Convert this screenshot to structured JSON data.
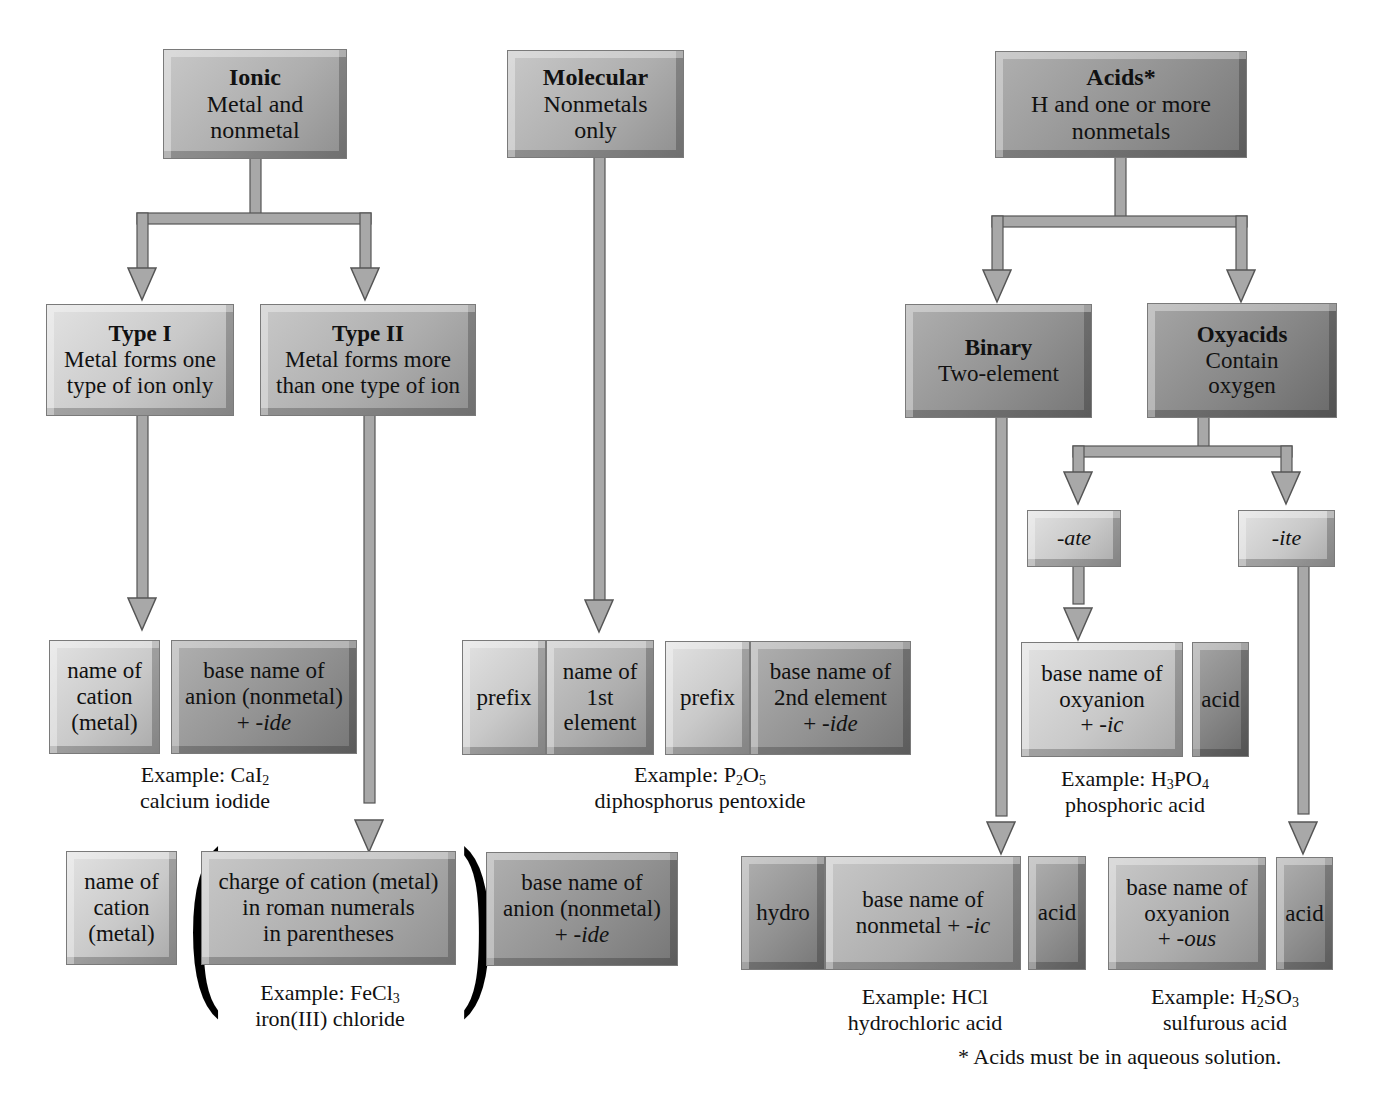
{
  "diagram": {
    "colors": {
      "box_light": "#d2d2d2",
      "box_medium": "#b0b0b0",
      "box_dark": "#929292",
      "arrow": "#a8a8a8",
      "arrow_shadow": "#555555",
      "text": "#111111"
    }
  },
  "ionic": {
    "title": "Ionic",
    "lines": [
      "Metal and",
      "nonmetal"
    ],
    "type1": {
      "title": "Type I",
      "lines": [
        "Metal forms one",
        "type of ion only"
      ],
      "cation_box": [
        "name of",
        "cation",
        "(metal)"
      ],
      "anion_box": [
        "base name of",
        "anion (nonmetal)",
        "+ ",
        "-ide"
      ],
      "example_label": "Example: ",
      "example_formula": {
        "main": "CaI",
        "sub": "2"
      },
      "example_name": "calcium iodide"
    },
    "type2": {
      "title": "Type II",
      "lines": [
        "Metal forms more",
        "than one type of ion"
      ],
      "cation_box": [
        "name of",
        "cation",
        "(metal)"
      ],
      "charge_box": [
        "charge of cation (metal)",
        "in roman numerals",
        "in parentheses"
      ],
      "anion_box": [
        "base name of",
        "anion (nonmetal)",
        "+ ",
        "-ide"
      ],
      "example_label": "Example: ",
      "example_formula": {
        "main": "FeCl",
        "sub": "3"
      },
      "example_name": "iron(III) chloride",
      "paren_open": "(",
      "paren_close": ")"
    }
  },
  "molecular": {
    "title": "Molecular",
    "lines": [
      "Nonmetals",
      "only"
    ],
    "prefix1": "prefix",
    "first_element": [
      "name of",
      "1st",
      "element"
    ],
    "prefix2": "prefix",
    "second_element": [
      "base name of",
      "2nd element",
      "+ ",
      "-ide"
    ],
    "example_label": "Example: ",
    "example_formula": {
      "p1": "P",
      "s1": "2",
      "p2": "O",
      "s2": "5"
    },
    "example_name": "diphosphorus pentoxide"
  },
  "acids": {
    "title": "Acids*",
    "lines": [
      "H and one or more",
      "nonmetals"
    ],
    "binary": {
      "title": "Binary",
      "lines": [
        "Two-element"
      ],
      "hydro": "hydro",
      "base_box": [
        "base name of",
        "nonmetal + ",
        "-ic"
      ],
      "acid": "acid",
      "example_label": "Example: ",
      "example_formula": "HCl",
      "example_name": "hydrochloric acid"
    },
    "oxyacids": {
      "title": "Oxyacids",
      "lines": [
        "Contain",
        "oxygen"
      ],
      "ate": {
        "label": "-ate",
        "base_box": [
          "base name of",
          "oxyanion",
          "+ ",
          "-ic"
        ],
        "acid": "acid",
        "example_label": "Example: ",
        "example_formula": {
          "p1": "H",
          "s1": "3",
          "p2": "PO",
          "s2": "4"
        },
        "example_name": "phosphoric acid"
      },
      "ite": {
        "label": "-ite",
        "base_box": [
          "base name of",
          "oxyanion",
          "+ ",
          "-ous"
        ],
        "acid": "acid",
        "example_label": "Example: ",
        "example_formula": {
          "p1": "H",
          "s1": "2",
          "p2": "SO",
          "s2": "3"
        },
        "example_name": "sulfurous acid"
      }
    },
    "footnote": "* Acids must be in aqueous solution."
  }
}
